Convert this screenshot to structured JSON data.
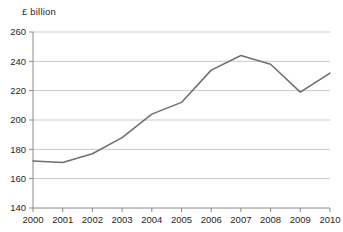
{
  "chart_data": {
    "type": "line",
    "title": "",
    "subtitle": "",
    "xlabel": "",
    "ylabel": "£ billion",
    "ylim": [
      140,
      260
    ],
    "xlim": [
      2000,
      2010
    ],
    "yticks": [
      140,
      160,
      180,
      200,
      220,
      240,
      260
    ],
    "grid": "horizontal",
    "legend": "none",
    "line_color": "#6e6e6e",
    "grid_color": "#c9c9c9",
    "axis_color": "#8a8a8a",
    "categories": [
      "2000",
      "2001",
      "2002",
      "2003",
      "2004",
      "2005",
      "2006",
      "2007",
      "2008",
      "2009",
      "2010"
    ],
    "x": [
      2000,
      2001,
      2002,
      2003,
      2004,
      2005,
      2006,
      2007,
      2008,
      2009,
      2010
    ],
    "values": [
      172,
      171,
      177,
      188,
      204,
      212,
      234,
      244,
      238,
      219,
      232
    ],
    "series": [
      {
        "name": "£ billion",
        "values": [
          172,
          171,
          177,
          188,
          204,
          212,
          234,
          244,
          238,
          219,
          232
        ]
      }
    ]
  },
  "axis": {
    "unit_label": "£ billion"
  }
}
